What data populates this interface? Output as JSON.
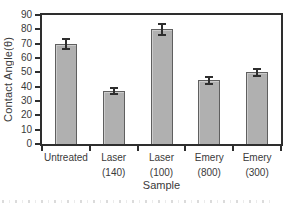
{
  "chart_data": {
    "type": "bar",
    "title": "",
    "xlabel": "Sample",
    "ylabel": "Contact Angle(θ)",
    "ylim": [
      0,
      90
    ],
    "yticks": [
      0,
      10,
      20,
      30,
      40,
      50,
      60,
      70,
      80,
      90
    ],
    "categories": [
      {
        "line1": "Untreated",
        "line2": ""
      },
      {
        "line1": "Laser",
        "line2": "(140)"
      },
      {
        "line1": "Laser",
        "line2": "(100)"
      },
      {
        "line1": "Emery",
        "line2": "(800)"
      },
      {
        "line1": "Emery",
        "line2": "(300)"
      }
    ],
    "values": [
      70,
      37,
      80,
      44.5,
      50
    ],
    "errors": [
      3.5,
      2,
      4,
      2.5,
      2.5
    ],
    "grid": false,
    "legend": null,
    "colors": {
      "bar_fill": "#b0b0b0",
      "bar_border": "#5f5f5f",
      "axis": "#2e2e2e",
      "text": "#3a3a3a",
      "background": "#ffffff"
    }
  }
}
